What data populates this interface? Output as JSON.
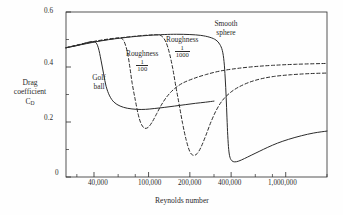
{
  "chart_data": {
    "type": "line",
    "title": "",
    "xlabel": "Reynolds number",
    "ylabel": "Drag coefficient C_D",
    "ylabel_lines": [
      "Drag",
      "coefficient",
      "C"
    ],
    "ylabel_sub": "D",
    "xscale": "log",
    "xlim": [
      25000,
      2000000
    ],
    "ylim": [
      0,
      0.6
    ],
    "grid": false,
    "legend_position": "inline-annotations",
    "xticks_major": [
      40000,
      100000,
      200000,
      400000,
      1000000
    ],
    "xticklabels": [
      "40,000",
      "100,000",
      "200,000",
      "400,000",
      "1,000,000"
    ],
    "xticks_minor": [
      30000,
      60000,
      80000,
      300000,
      600000,
      800000,
      2000000
    ],
    "yticks_major": [
      0,
      0.2,
      0.4,
      0.6
    ],
    "yticklabels": [
      "0",
      "0.2",
      "0.4",
      "0.6"
    ],
    "yticks_minor": [
      0.1,
      0.3,
      0.5
    ],
    "series": [
      {
        "name": "Golf ball",
        "style": "solid",
        "label": "Golf ball",
        "label_lines": [
          "Golf",
          "ball"
        ],
        "points": [
          [
            25000,
            0.47
          ],
          [
            30000,
            0.478
          ],
          [
            34000,
            0.486
          ],
          [
            38000,
            0.492
          ],
          [
            41000,
            0.49
          ],
          [
            43000,
            0.47
          ],
          [
            45000,
            0.425
          ],
          [
            47000,
            0.375
          ],
          [
            49000,
            0.33
          ],
          [
            52000,
            0.295
          ],
          [
            56000,
            0.272
          ],
          [
            62000,
            0.258
          ],
          [
            70000,
            0.25
          ],
          [
            82000,
            0.246
          ],
          [
            95000,
            0.246
          ],
          [
            110000,
            0.249
          ],
          [
            130000,
            0.253
          ],
          [
            155000,
            0.258
          ],
          [
            185000,
            0.263
          ],
          [
            220000,
            0.268
          ],
          [
            260000,
            0.272
          ],
          [
            300000,
            0.276
          ]
        ]
      },
      {
        "name": "Roughness 1/100",
        "style": "dashed",
        "label": "Roughness",
        "fraction_num": "1",
        "fraction_den": "100",
        "points": [
          [
            25000,
            0.47
          ],
          [
            32000,
            0.483
          ],
          [
            42000,
            0.495
          ],
          [
            55000,
            0.504
          ],
          [
            62000,
            0.505
          ],
          [
            66000,
            0.495
          ],
          [
            70000,
            0.455
          ],
          [
            73000,
            0.4
          ],
          [
            76000,
            0.34
          ],
          [
            80000,
            0.28
          ],
          [
            84000,
            0.228
          ],
          [
            88000,
            0.195
          ],
          [
            93000,
            0.178
          ],
          [
            99000,
            0.18
          ],
          [
            106000,
            0.199
          ],
          [
            114000,
            0.228
          ],
          [
            124000,
            0.262
          ],
          [
            136000,
            0.292
          ],
          [
            152000,
            0.318
          ],
          [
            175000,
            0.34
          ],
          [
            210000,
            0.357
          ],
          [
            260000,
            0.372
          ],
          [
            330000,
            0.385
          ],
          [
            430000,
            0.394
          ],
          [
            580000,
            0.401
          ],
          [
            800000,
            0.406
          ],
          [
            1200000,
            0.41
          ],
          [
            2000000,
            0.413
          ]
        ]
      },
      {
        "name": "Roughness 1/1000",
        "style": "dashed",
        "label": "Roughness",
        "fraction_num": "1",
        "fraction_den": "1000",
        "points": [
          [
            25000,
            0.47
          ],
          [
            40000,
            0.492
          ],
          [
            60000,
            0.505
          ],
          [
            80000,
            0.512
          ],
          [
            100000,
            0.516
          ],
          [
            115000,
            0.517
          ],
          [
            125000,
            0.512
          ],
          [
            134000,
            0.49
          ],
          [
            142000,
            0.45
          ],
          [
            150000,
            0.395
          ],
          [
            158000,
            0.33
          ],
          [
            167000,
            0.265
          ],
          [
            177000,
            0.195
          ],
          [
            188000,
            0.135
          ],
          [
            200000,
            0.092
          ],
          [
            212000,
            0.079
          ],
          [
            226000,
            0.085
          ],
          [
            242000,
            0.11
          ],
          [
            262000,
            0.152
          ],
          [
            285000,
            0.2
          ],
          [
            312000,
            0.243
          ],
          [
            345000,
            0.278
          ],
          [
            390000,
            0.305
          ],
          [
            450000,
            0.326
          ],
          [
            540000,
            0.344
          ],
          [
            660000,
            0.357
          ],
          [
            830000,
            0.366
          ],
          [
            1100000,
            0.372
          ],
          [
            1500000,
            0.376
          ],
          [
            2000000,
            0.378
          ]
        ]
      },
      {
        "name": "Smooth sphere",
        "style": "solid",
        "label": "Smooth sphere",
        "label_lines": [
          "Smooth",
          "sphere"
        ],
        "points": [
          [
            25000,
            0.47
          ],
          [
            45000,
            0.495
          ],
          [
            70000,
            0.508
          ],
          [
            100000,
            0.515
          ],
          [
            130000,
            0.518
          ],
          [
            160000,
            0.519
          ],
          [
            200000,
            0.518
          ],
          [
            240000,
            0.515
          ],
          [
            280000,
            0.508
          ],
          [
            310000,
            0.498
          ],
          [
            330000,
            0.483
          ],
          [
            345000,
            0.46
          ],
          [
            355000,
            0.42
          ],
          [
            362000,
            0.36
          ],
          [
            368000,
            0.29
          ],
          [
            373000,
            0.215
          ],
          [
            378000,
            0.15
          ],
          [
            384000,
            0.1
          ],
          [
            392000,
            0.072
          ],
          [
            405000,
            0.059
          ],
          [
            425000,
            0.055
          ],
          [
            455000,
            0.058
          ],
          [
            500000,
            0.067
          ],
          [
            560000,
            0.079
          ],
          [
            640000,
            0.093
          ],
          [
            740000,
            0.108
          ],
          [
            870000,
            0.123
          ],
          [
            1050000,
            0.137
          ],
          [
            1300000,
            0.15
          ],
          [
            1600000,
            0.16
          ],
          [
            2000000,
            0.167
          ]
        ]
      }
    ],
    "annotations": [
      {
        "name": "golf-ball-label",
        "text": "Golf ball"
      },
      {
        "name": "roughness-100-label",
        "text": "Roughness 1/100"
      },
      {
        "name": "roughness-1000-label",
        "text": "Roughness 1/1000"
      },
      {
        "name": "smooth-sphere-label",
        "text": "Smooth sphere"
      }
    ]
  },
  "colors": {
    "ink": "#2b2b2b",
    "background": "#ffffff",
    "curve": "#2b2b2b"
  }
}
